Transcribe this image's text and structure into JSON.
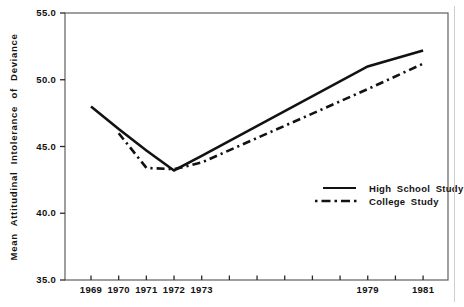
{
  "figure": {
    "background": "#ffffff",
    "ink_color": "#121212",
    "frame_color": "#5f5f5f"
  },
  "chart_data": {
    "type": "line",
    "title": "",
    "xlabel": "",
    "ylabel": "Mean Attitudinal Intolerance of Deviance",
    "grid": false,
    "x_axis": {
      "range": [
        1968.06,
        1981.9
      ],
      "ticks": [
        1969,
        1970,
        1971,
        1972,
        1973,
        1974,
        1975,
        1976,
        1977,
        1978,
        1979,
        1980,
        1981
      ],
      "labels": {
        "1969": "1969",
        "1970": "1970",
        "1971": "1971",
        "1972": "1972",
        "1973": "1973",
        "1979": "1979",
        "1981": "1981"
      }
    },
    "y_axis": {
      "range": [
        35,
        55
      ],
      "ticks": [
        35,
        40,
        45,
        50,
        55
      ],
      "labels": {
        "35": "35.0",
        "40": "40.0",
        "45": "45.0",
        "50": "50.0",
        "55": "55.0"
      },
      "title": "Mean Attitudinal Intolerance of Deviance"
    },
    "series": [
      {
        "name": "High School Study",
        "line_style": "solid",
        "color": "#121212",
        "points": [
          [
            1969,
            48.0
          ],
          [
            1970,
            46.3
          ],
          [
            1971,
            44.7
          ],
          [
            1972,
            43.2
          ],
          [
            1973,
            44.3
          ],
          [
            1979,
            51.0
          ],
          [
            1981,
            52.2
          ]
        ]
      },
      {
        "name": "College Study",
        "line_style": "dash-dot",
        "color": "#121212",
        "points": [
          [
            1970,
            46.0
          ],
          [
            1971,
            43.4
          ],
          [
            1972,
            43.3
          ],
          [
            1973,
            43.8
          ],
          [
            1979,
            49.3
          ],
          [
            1981,
            51.2
          ]
        ]
      }
    ],
    "legend": {
      "position": "center-right",
      "entries": [
        "High School Study",
        "College Study"
      ]
    }
  }
}
